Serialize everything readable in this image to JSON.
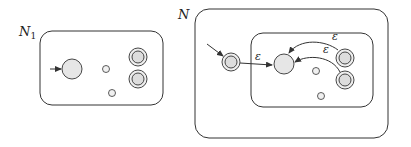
{
  "diagram": {
    "left": {
      "label": "N",
      "subscript": "1",
      "box": {
        "x": 40,
        "y": 31,
        "w": 123,
        "h": 74,
        "r": 12
      },
      "start_state": {
        "cx": 72,
        "cy": 69,
        "r": 10
      },
      "start_arrow": {
        "x1": 50,
        "y1": 69
      },
      "states": [
        {
          "cx": 106,
          "cy": 69,
          "r": 3.5
        },
        {
          "cx": 112,
          "cy": 93,
          "r": 3.5
        }
      ],
      "accept_states": [
        {
          "cx": 138,
          "cy": 57
        },
        {
          "cx": 138,
          "cy": 79
        }
      ]
    },
    "right": {
      "label": "N",
      "outer_box": {
        "x": 195,
        "y": 9,
        "w": 193,
        "h": 129,
        "r": 14
      },
      "inner_box": {
        "x": 251,
        "y": 33,
        "w": 122,
        "h": 74,
        "r": 12
      },
      "new_start_state": {
        "cx": 231,
        "cy": 62
      },
      "start_arrow": {
        "x1": 207,
        "y1": 44
      },
      "inner_start_state": {
        "cx": 284,
        "cy": 64,
        "r": 10
      },
      "states": [
        {
          "cx": 316,
          "cy": 71,
          "r": 3.5
        },
        {
          "cx": 321,
          "cy": 96,
          "r": 3.5
        }
      ],
      "accept_states": [
        {
          "cx": 345,
          "cy": 58
        },
        {
          "cx": 345,
          "cy": 80
        }
      ],
      "epsilon_label": "ε"
    },
    "colors": {
      "stroke": "#333333",
      "state_fill": "#e6e6e6",
      "background": "#ffffff"
    }
  }
}
